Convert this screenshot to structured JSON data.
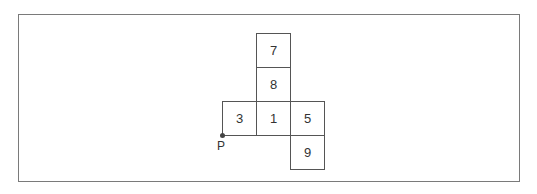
{
  "diagram": {
    "type": "cube-net",
    "cells": [
      {
        "label": "7",
        "col": 1,
        "row": 0
      },
      {
        "label": "8",
        "col": 1,
        "row": 1
      },
      {
        "label": "3",
        "col": 0,
        "row": 2
      },
      {
        "label": "1",
        "col": 1,
        "row": 2
      },
      {
        "label": "5",
        "col": 2,
        "row": 2
      },
      {
        "label": "9",
        "col": 2,
        "row": 3
      }
    ],
    "point_label": "P"
  }
}
